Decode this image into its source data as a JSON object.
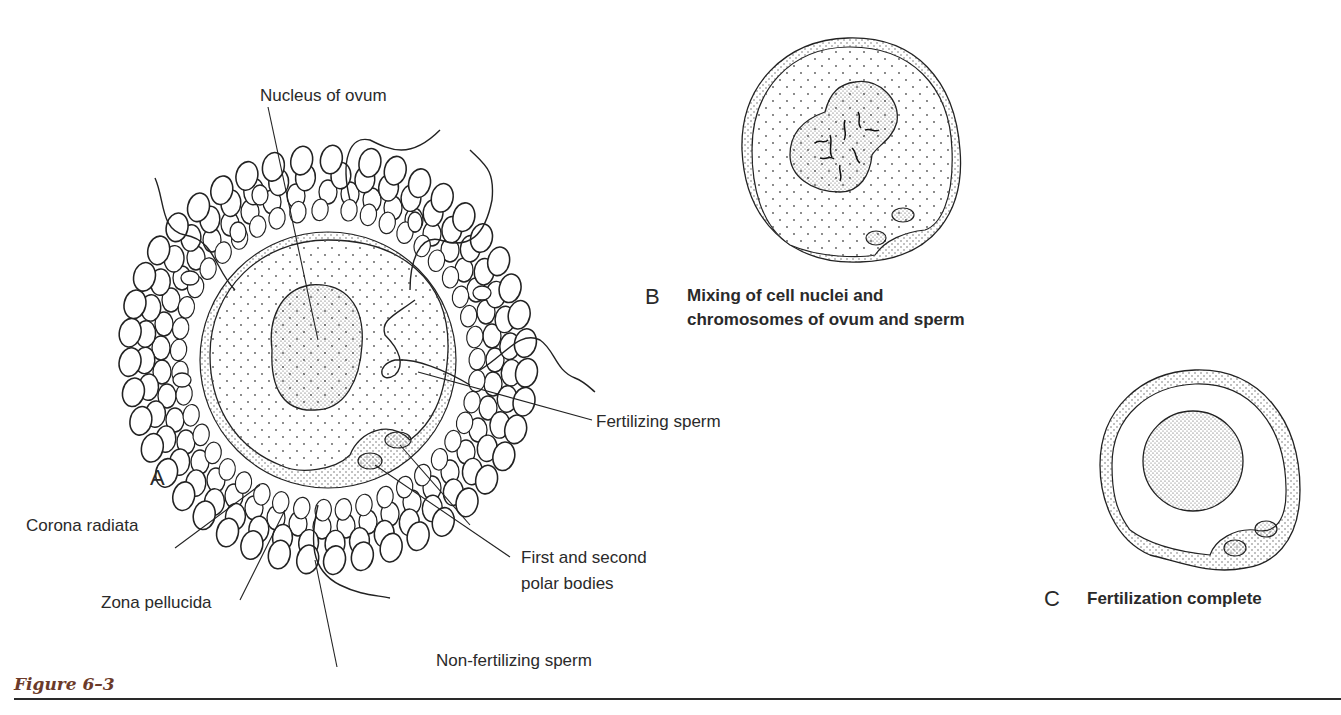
{
  "figure": {
    "caption": "Figure 6–3",
    "panels": {
      "A": {
        "letter": "A",
        "labels": {
          "nucleus": "Nucleus of ovum",
          "fertilizing_sperm": "Fertilizing sperm",
          "corona": "Corona radiata",
          "zona": "Zona pellucida",
          "polar_line1": "First and second",
          "polar_line2": "polar bodies",
          "nonfert": "Non-fertilizing sperm"
        }
      },
      "B": {
        "letter": "B",
        "caption_line1": "Mixing of cell nuclei and",
        "caption_line2": "chromosomes of ovum and sperm"
      },
      "C": {
        "letter": "C",
        "caption": "Fertilization complete"
      }
    },
    "colors": {
      "ink": "#2a2a2a",
      "caption": "#6b3a2a"
    }
  }
}
